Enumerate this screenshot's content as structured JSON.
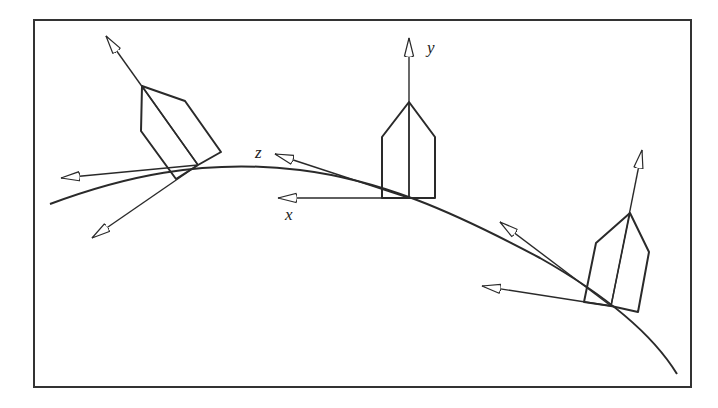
{
  "figure": {
    "border": {
      "x": 34,
      "y": 20,
      "width": 657,
      "height": 367,
      "color": "#333333"
    },
    "stroke_color": "#2a2a2a",
    "curve_path": "M 50 204 C 120 178, 200 158, 300 170 C 380 180, 450 210, 540 258 C 600 292, 650 330, 677 374",
    "axis_labels": {
      "x": "x",
      "y": "y",
      "z": "z"
    },
    "frames": [
      {
        "id": "left",
        "origin": [
          198,
          165
        ],
        "house": "M176 179 L141 131 L142 86 L185 101 L221 152 L198 165 L176 179 Z",
        "ridge": [
          [
            142,
            86
          ],
          [
            198,
            165
          ]
        ],
        "axes": [
          {
            "name": "up",
            "to": [
              106,
              36
            ]
          },
          {
            "name": "left",
            "to": [
              61,
              178
            ]
          },
          {
            "name": "down",
            "to": [
              92,
              238
            ]
          }
        ]
      },
      {
        "id": "middle",
        "origin": [
          409,
          198
        ],
        "house": "M382 198 L382 137 L409 102 L435 137 L435 198 Z",
        "ridge": [
          [
            409,
            102
          ],
          [
            409,
            198
          ]
        ],
        "axes": [
          {
            "name": "y",
            "to": [
              409,
              38
            ]
          },
          {
            "name": "x",
            "to": [
              278,
              198
            ]
          },
          {
            "name": "z",
            "to": [
              275,
              154
            ]
          }
        ]
      },
      {
        "id": "right",
        "origin": [
          611,
          306
        ],
        "house": "M584 302 L596 243 L630 213 L649 252 L638 312 L611 306 Z",
        "ridge": [
          [
            630,
            213
          ],
          [
            611,
            306
          ]
        ],
        "axes": [
          {
            "name": "up",
            "to": [
              642,
              150
            ]
          },
          {
            "name": "left",
            "to": [
              482,
              286
            ]
          },
          {
            "name": "tangent",
            "to": [
              500,
              222
            ]
          }
        ]
      }
    ]
  }
}
